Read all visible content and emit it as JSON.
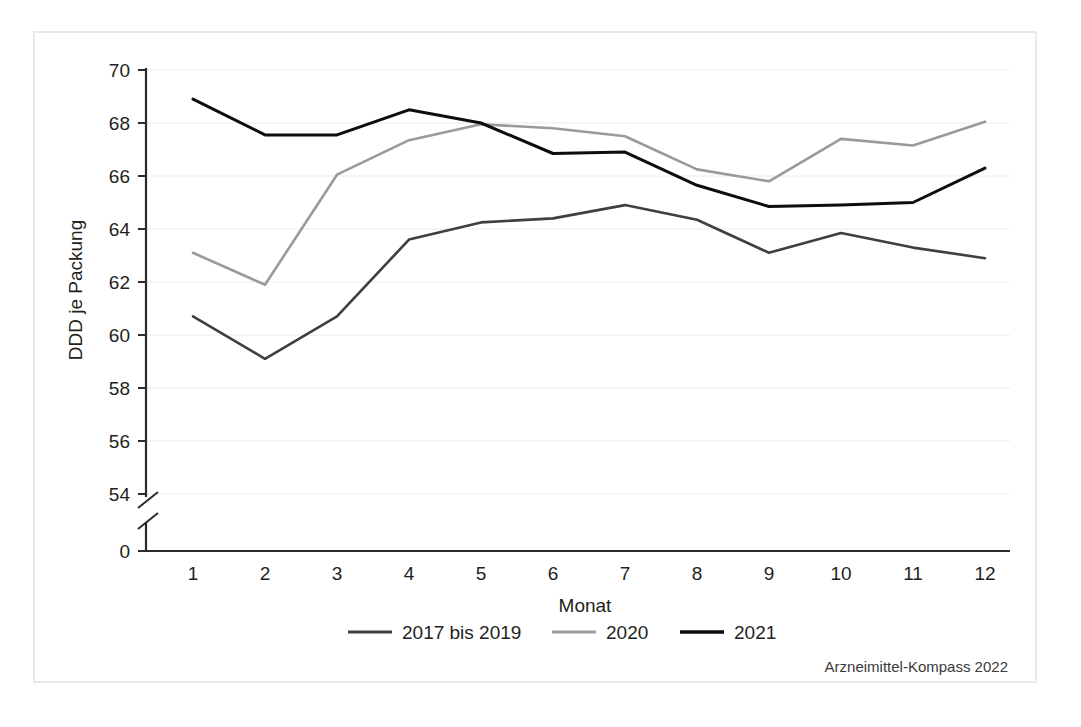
{
  "chart_data": {
    "type": "line",
    "title": "",
    "xlabel": "Monat",
    "ylabel": "DDD je Packung",
    "categories": [
      "1",
      "2",
      "3",
      "4",
      "5",
      "6",
      "7",
      "8",
      "9",
      "10",
      "11",
      "12"
    ],
    "x": [
      1,
      2,
      3,
      4,
      5,
      6,
      7,
      8,
      9,
      10,
      11,
      12
    ],
    "xlim": [
      0.5,
      12.5
    ],
    "ylim": [
      54,
      70
    ],
    "yticks": [
      "0",
      "54",
      "56",
      "58",
      "60",
      "62",
      "64",
      "66",
      "68",
      "70"
    ],
    "ytick_values": [
      0,
      54,
      56,
      58,
      60,
      62,
      64,
      66,
      68,
      70
    ],
    "axis_break": true,
    "axis_break_note": "Y-Achse unterbrochen zwischen 0 und 54",
    "grid": "horizontal",
    "legend_position": "bottom",
    "series": [
      {
        "name": "2017 bis 2019",
        "color": "#3f3f3f",
        "values": [
          60.7,
          59.1,
          60.7,
          63.6,
          64.25,
          64.4,
          64.9,
          64.35,
          63.1,
          63.85,
          63.3,
          62.9
        ]
      },
      {
        "name": "2020",
        "color": "#9a9a9a",
        "values": [
          63.1,
          61.9,
          66.05,
          67.35,
          67.95,
          67.8,
          67.5,
          66.25,
          65.8,
          67.4,
          67.15,
          68.05
        ]
      },
      {
        "name": "2021",
        "color": "#0d0d0d",
        "values": [
          68.9,
          67.55,
          67.55,
          68.5,
          68.0,
          66.85,
          66.9,
          65.65,
          64.85,
          64.9,
          65.0,
          66.3
        ]
      }
    ],
    "source": "Arzneimittel-Kompass 2022"
  },
  "axes": {
    "y_title": "DDD je Packung",
    "x_title": "Monat",
    "y_tick_labels": [
      "70",
      "68",
      "66",
      "64",
      "62",
      "60",
      "58",
      "56",
      "54",
      "0"
    ],
    "x_tick_labels": [
      "1",
      "2",
      "3",
      "4",
      "5",
      "6",
      "7",
      "8",
      "9",
      "10",
      "11",
      "12"
    ]
  },
  "legend": {
    "items": [
      {
        "label": "2017 bis 2019",
        "color": "#3f3f3f"
      },
      {
        "label": "2020",
        "color": "#9a9a9a"
      },
      {
        "label": "2021",
        "color": "#0d0d0d"
      }
    ]
  },
  "footer": {
    "source": "Arzneimittel-Kompass 2022"
  },
  "colors": {
    "frame": "#e9e9e9",
    "gridline": "#f2f2f2",
    "axis": "#2b2b2b",
    "background": "#ffffff"
  }
}
